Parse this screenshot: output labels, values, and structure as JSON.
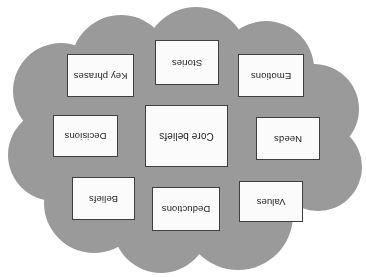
{
  "diagram": {
    "type": "cloud-concept-map",
    "orientation_degrees": 180,
    "cloud": {
      "name": "cloud-shape",
      "fill_color": "#9a9a9a",
      "border_color": "#9a9a9a"
    },
    "box_style": {
      "fill_color": "#fbfbfb",
      "border_color": "#3f3f3f",
      "text_color": "#1d1d1d"
    },
    "center_node": {
      "label": "Core beliefs"
    },
    "nodes": [
      {
        "label": "Values",
        "position": "top-left"
      },
      {
        "label": "Deductions",
        "position": "top-center"
      },
      {
        "label": "Beliefs",
        "position": "top-right"
      },
      {
        "label": "Needs",
        "position": "middle-left"
      },
      {
        "label": "Core beliefs",
        "position": "center"
      },
      {
        "label": "Decisions",
        "position": "middle-right"
      },
      {
        "label": "Emotions",
        "position": "bottom-left"
      },
      {
        "label": "Stories",
        "position": "bottom-center"
      },
      {
        "label": "Key phrases",
        "position": "bottom-right"
      }
    ]
  }
}
